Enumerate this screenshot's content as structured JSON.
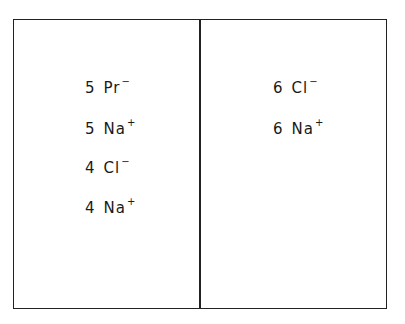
{
  "compartments": [
    {
      "name": "left",
      "ions": [
        {
          "count": "5",
          "symbol": "Pr",
          "charge": "−"
        },
        {
          "count": "5",
          "symbol": "Na",
          "charge": "+"
        },
        {
          "count": "4",
          "symbol": "Cl",
          "charge": "−"
        },
        {
          "count": "4",
          "symbol": "Na",
          "charge": "+"
        }
      ]
    },
    {
      "name": "right",
      "ions": [
        {
          "count": "6",
          "symbol": "Cl",
          "charge": "−"
        },
        {
          "count": "6",
          "symbol": "Na",
          "charge": "+"
        }
      ]
    }
  ]
}
